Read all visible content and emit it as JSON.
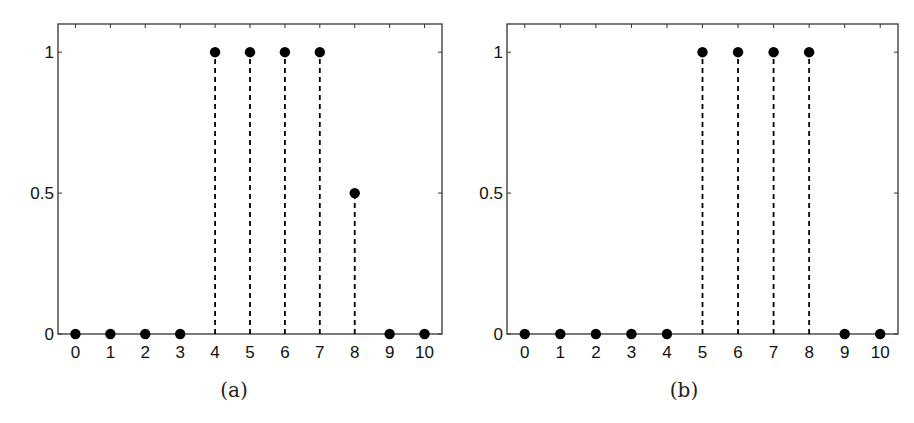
{
  "chart_data": [
    {
      "type": "scatter",
      "style": "stem",
      "caption": "(a)",
      "x": [
        0,
        1,
        2,
        3,
        4,
        5,
        6,
        7,
        8,
        9,
        10
      ],
      "values": [
        0,
        0,
        0,
        0,
        1,
        1,
        1,
        1,
        0.5,
        0,
        0
      ],
      "xticks": [
        "0",
        "1",
        "2",
        "3",
        "4",
        "5",
        "6",
        "7",
        "8",
        "9",
        "10"
      ],
      "yticks": [
        "0",
        "0.5",
        "1"
      ],
      "xlim": [
        -0.5,
        10.5
      ],
      "ylim": [
        0,
        1.1
      ],
      "grid": false,
      "title": "",
      "xlabel": "",
      "ylabel": ""
    },
    {
      "type": "scatter",
      "style": "stem",
      "caption": "(b)",
      "x": [
        0,
        1,
        2,
        3,
        4,
        5,
        6,
        7,
        8,
        9,
        10
      ],
      "values": [
        0,
        0,
        0,
        0,
        0,
        1,
        1,
        1,
        1,
        0,
        0
      ],
      "xticks": [
        "0",
        "1",
        "2",
        "3",
        "4",
        "5",
        "6",
        "7",
        "8",
        "9",
        "10"
      ],
      "yticks": [
        "0",
        "0.5",
        "1"
      ],
      "xlim": [
        -0.5,
        10.5
      ],
      "ylim": [
        0,
        1.1
      ],
      "grid": false,
      "title": "",
      "xlabel": "",
      "ylabel": ""
    }
  ],
  "colors": {
    "marker": "#000000",
    "axes": "#333333",
    "text": "#111111"
  }
}
